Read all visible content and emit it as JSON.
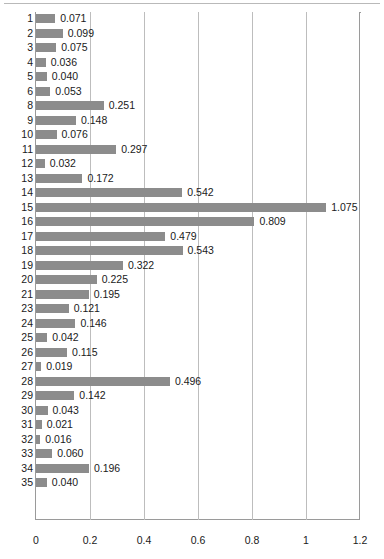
{
  "chart_data": {
    "type": "bar",
    "orientation": "horizontal",
    "title": "",
    "xlabel": "",
    "ylabel": "",
    "xlim": [
      0,
      1.2
    ],
    "xticks": [
      "0",
      "0.2",
      "0.4",
      "0.6",
      "0.8",
      "1",
      "1.2"
    ],
    "xtick_values": [
      0,
      0.2,
      0.4,
      0.6,
      0.8,
      1.0,
      1.2
    ],
    "grid": true,
    "legend": "none",
    "bar_color": "#8c8c8c",
    "gridline_color": "#bdbdbd",
    "axis_color": "#9a9a9a",
    "categories": [
      "1",
      "2",
      "3",
      "4",
      "5",
      "6",
      "8",
      "9",
      "10",
      "11",
      "12",
      "13",
      "14",
      "15",
      "16",
      "17",
      "18",
      "19",
      "20",
      "21",
      "23",
      "24",
      "25",
      "26",
      "27",
      "28",
      "29",
      "30",
      "31",
      "32",
      "33",
      "34",
      "35"
    ],
    "values": [
      0.071,
      0.099,
      0.075,
      0.036,
      0.04,
      0.053,
      0.251,
      0.148,
      0.076,
      0.297,
      0.032,
      0.172,
      0.542,
      1.075,
      0.809,
      0.479,
      0.543,
      0.322,
      0.225,
      0.195,
      0.121,
      0.146,
      0.042,
      0.115,
      0.019,
      0.496,
      0.142,
      0.043,
      0.021,
      0.016,
      0.06,
      0.196,
      0.04
    ],
    "data_labels": [
      "0.071",
      "0.099",
      "0.075",
      "0.036",
      "0.040",
      "0.053",
      "0.251",
      "0.148",
      "0.076",
      "0.297",
      "0.032",
      "0.172",
      "0.542",
      "1.075",
      "0.809",
      "0.479",
      "0.543",
      "0.322",
      "0.225",
      "0.195",
      "0.121",
      "0.146",
      "0.042",
      "0.115",
      "0.019",
      "0.496",
      "0.142",
      "0.043",
      "0.021",
      "0.016",
      "0.060",
      "0.196",
      "0.040"
    ],
    "rows": [
      {
        "category": "1",
        "value": 0.071,
        "label": "0.071"
      },
      {
        "category": "2",
        "value": 0.099,
        "label": "0.099"
      },
      {
        "category": "3",
        "value": 0.075,
        "label": "0.075"
      },
      {
        "category": "4",
        "value": 0.036,
        "label": "0.036"
      },
      {
        "category": "5",
        "value": 0.04,
        "label": "0.040"
      },
      {
        "category": "6",
        "value": 0.053,
        "label": "0.053"
      },
      {
        "category": "8",
        "value": 0.251,
        "label": "0.251"
      },
      {
        "category": "9",
        "value": 0.148,
        "label": "0.148"
      },
      {
        "category": "10",
        "value": 0.076,
        "label": "0.076"
      },
      {
        "category": "11",
        "value": 0.297,
        "label": "0.297"
      },
      {
        "category": "12",
        "value": 0.032,
        "label": "0.032"
      },
      {
        "category": "13",
        "value": 0.172,
        "label": "0.172"
      },
      {
        "category": "14",
        "value": 0.542,
        "label": "0.542"
      },
      {
        "category": "15",
        "value": 1.075,
        "label": "1.075"
      },
      {
        "category": "16",
        "value": 0.809,
        "label": "0.809"
      },
      {
        "category": "17",
        "value": 0.479,
        "label": "0.479"
      },
      {
        "category": "18",
        "value": 0.543,
        "label": "0.543"
      },
      {
        "category": "19",
        "value": 0.322,
        "label": "0.322"
      },
      {
        "category": "20",
        "value": 0.225,
        "label": "0.225"
      },
      {
        "category": "21",
        "value": 0.195,
        "label": "0.195"
      },
      {
        "category": "23",
        "value": 0.121,
        "label": "0.121"
      },
      {
        "category": "24",
        "value": 0.146,
        "label": "0.146"
      },
      {
        "category": "25",
        "value": 0.042,
        "label": "0.042"
      },
      {
        "category": "26",
        "value": 0.115,
        "label": "0.115"
      },
      {
        "category": "27",
        "value": 0.019,
        "label": "0.019"
      },
      {
        "category": "28",
        "value": 0.496,
        "label": "0.496"
      },
      {
        "category": "29",
        "value": 0.142,
        "label": "0.142"
      },
      {
        "category": "30",
        "value": 0.043,
        "label": "0.043"
      },
      {
        "category": "31",
        "value": 0.021,
        "label": "0.021"
      },
      {
        "category": "32",
        "value": 0.016,
        "label": "0.016"
      },
      {
        "category": "33",
        "value": 0.06,
        "label": "0.060"
      },
      {
        "category": "34",
        "value": 0.196,
        "label": "0.196"
      },
      {
        "category": "35",
        "value": 0.04,
        "label": "0.040"
      }
    ]
  }
}
